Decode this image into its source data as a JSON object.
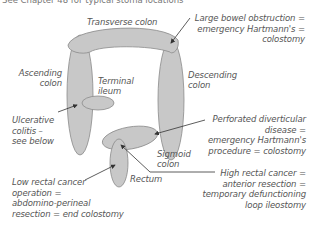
{
  "header": {
    "text": "See Chapter 48 for typical stoma locations"
  },
  "anatomy": {
    "transverse": "Transverse colon",
    "ascending": [
      "Ascending",
      "colon"
    ],
    "descending": [
      "Descending",
      "colon"
    ],
    "terminal_ileum": [
      "Terminal",
      "ileum"
    ],
    "sigmoid": [
      "Sigmoid",
      "colon"
    ],
    "rectum": "Rectum"
  },
  "notes": {
    "large_bowel": [
      "Large bowel obstruction =",
      "emergency Hartmann's =",
      "colostomy"
    ],
    "ulcerative": [
      "Ulcerative",
      "colitis –",
      "see below"
    ],
    "perforated": [
      "Perforated diverticular",
      "disease =",
      "emergency Hartmann's",
      "procedure = colostomy"
    ],
    "high_rectal": [
      "High rectal cancer =",
      "anterior resection =",
      "temporary defunctioning",
      "loop ileostomy"
    ],
    "low_rectal": [
      "Low rectal cancer",
      "operation =",
      "abdomino-perineal",
      "resection = end colostomy"
    ]
  },
  "colors": {
    "organ_fill": "#c8c8c8",
    "organ_stroke": "#8a8a8a",
    "text": "#555555",
    "arrow": "#333333"
  }
}
